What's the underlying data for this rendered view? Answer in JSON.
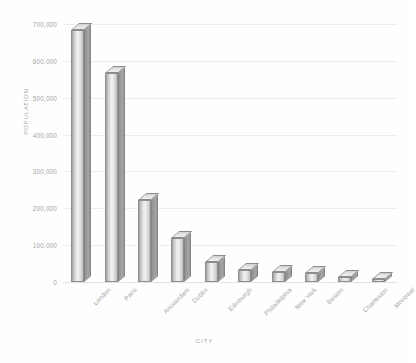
{
  "chart_data": {
    "type": "bar",
    "title": "",
    "xlabel": "CITY",
    "ylabel": "POPULATION",
    "categories": [
      "London",
      "Paris",
      "Amsterdam",
      "Dublin",
      "Edinburgh",
      "Philadelphia",
      "New York",
      "Boston",
      "Charleston",
      "Montreal"
    ],
    "values": [
      683000,
      567000,
      222000,
      119000,
      54000,
      32000,
      27000,
      25000,
      13000,
      8000
    ],
    "series": [
      {
        "name": "Population",
        "values": [
          683000,
          567000,
          222000,
          119000,
          54000,
          32000,
          27000,
          25000,
          13000,
          8000
        ]
      }
    ],
    "ylim": [
      0,
      700000
    ],
    "ytick_step": 100000,
    "ytick_labels": [
      "0",
      "100,000",
      "200,000",
      "300,000",
      "400,000",
      "500,000",
      "600,000",
      "700,000"
    ],
    "ytick_values": [
      0,
      100000,
      200000,
      300000,
      400000,
      500000,
      600000,
      700000
    ],
    "grid": true,
    "grid_axis": "y",
    "legend": false,
    "legend_position": "none",
    "style": "3d-column",
    "bar_color": "#d9d9d9",
    "grid_color": "#ededed",
    "text_color": "#a3a3a3",
    "background_color": "#ffffff"
  },
  "axes": {
    "y_title": "POPULATION",
    "x_title": "CITY"
  }
}
